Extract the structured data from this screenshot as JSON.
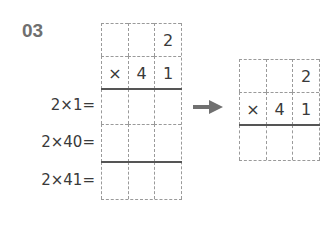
{
  "problem_number": "03",
  "left_grid": {
    "rows": [
      [
        "",
        "",
        "2"
      ],
      [
        "×",
        "4",
        "1"
      ],
      [
        "",
        "",
        ""
      ],
      [
        "",
        "",
        ""
      ],
      [
        "",
        "",
        ""
      ]
    ]
  },
  "labels": [
    "2×1=",
    "2×40=",
    "2×41="
  ],
  "right_grid": {
    "rows": [
      [
        "",
        "",
        "2"
      ],
      [
        "×",
        "4",
        "1"
      ],
      [
        "",
        "",
        ""
      ]
    ]
  },
  "arrow_icon": "right-arrow-icon"
}
